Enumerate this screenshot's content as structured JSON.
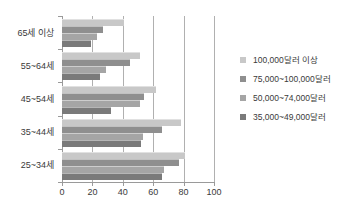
{
  "chart_data": {
    "type": "bar",
    "orientation": "horizontal",
    "title": "",
    "xlabel": "",
    "ylabel": "",
    "xlim": [
      0,
      100
    ],
    "xticks": [
      0,
      20,
      40,
      60,
      80,
      100
    ],
    "grid": true,
    "legend_position": "right",
    "categories": [
      "65세 이상",
      "55~64세",
      "45~54세",
      "35~44세",
      "25~34세"
    ],
    "series": [
      {
        "name": "100,000달러 이상",
        "color": "#c8c8c8",
        "values": [
          41,
          51,
          62,
          78,
          81
        ]
      },
      {
        "name": "75,000~100,000달러",
        "color": "#8f8f8f",
        "values": [
          27,
          45,
          54,
          66,
          77
        ]
      },
      {
        "name": "50,000~74,000달러",
        "color": "#a5a5a5",
        "values": [
          23,
          29,
          51,
          53,
          67
        ]
      },
      {
        "name": "35,000~49,000달러",
        "color": "#7a7a7a",
        "values": [
          19,
          25,
          32,
          52,
          66
        ]
      }
    ]
  },
  "axis": {
    "tick_labels": [
      "0",
      "20",
      "40",
      "60",
      "80",
      "100"
    ]
  },
  "legend": {
    "items": [
      {
        "label": "100,000달러 이상"
      },
      {
        "label": "75,000~100,000달러"
      },
      {
        "label": "50,000~74,000달러"
      },
      {
        "label": "35,000~49,000달러"
      }
    ]
  }
}
